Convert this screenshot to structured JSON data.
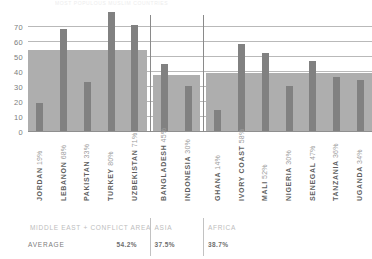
{
  "header": {
    "title": "MOST POPULOUS MUSLIM COUNTRIES"
  },
  "chart_data": {
    "type": "bar",
    "title": "MOST POPULOUS MUSLIM COUNTRIES",
    "xlabel": "",
    "ylabel": "",
    "ylim": [
      0,
      75
    ],
    "yticks": [
      0,
      10,
      20,
      30,
      40,
      50,
      60,
      70
    ],
    "grid": true,
    "legend": "none",
    "categories": [
      "JORDAN",
      "LEBANON",
      "PAKISTAN",
      "TURKEY",
      "UZBEKISTAN",
      "BANGLADESH",
      "INDONESIA",
      "GHANA",
      "IVORY COAST",
      "MALI",
      "NIGERIA",
      "SENEGAL",
      "TANZANIA",
      "UGANDA"
    ],
    "values": [
      19,
      68,
      33,
      80,
      71,
      45,
      30,
      14,
      58,
      52,
      30,
      47,
      36,
      34
    ],
    "value_labels": [
      "19%",
      "68%",
      "33%",
      "80%",
      "71%",
      "45%",
      "30%",
      "14%",
      "58%",
      "52%",
      "30%",
      "47%",
      "36%",
      "34%"
    ],
    "groups": [
      {
        "name": "MIDDLE EAST + CONFLICT AREA",
        "average": 54.2,
        "average_label": "54.2%",
        "members": [
          "JORDAN",
          "LEBANON",
          "PAKISTAN",
          "TURKEY",
          "UZBEKISTAN"
        ]
      },
      {
        "name": "ASIA",
        "average": 37.5,
        "average_label": "37.5%",
        "members": [
          "BANGLADESH",
          "INDONESIA"
        ]
      },
      {
        "name": "AFRICA",
        "average": 38.7,
        "average_label": "38.7%",
        "members": [
          "GHANA",
          "IVORY COAST",
          "MALI",
          "NIGERIA",
          "SENEGAL",
          "TANZANIA",
          "UGANDA"
        ]
      }
    ],
    "average_row_label": "AVERAGE",
    "colors": {
      "bar": "#818181",
      "average_band": "#aeaeae",
      "grid": "#b9b9b9",
      "text": "#6e6e6e"
    }
  }
}
